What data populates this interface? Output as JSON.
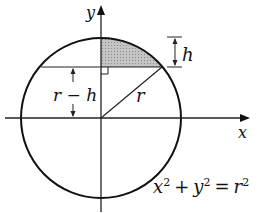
{
  "diagram": {
    "axes": {
      "x_label": "x",
      "y_label": "y"
    },
    "labels": {
      "h": "h",
      "r_minus_h": "r − h",
      "r": "r"
    },
    "equation": {
      "x": "x",
      "x_exp": "2",
      "plus": "+",
      "y": "y",
      "y_exp": "2",
      "equals": "=",
      "r": "r",
      "r_exp": "2"
    },
    "colors": {
      "stroke": "#111111",
      "shading": "#b8b8b8",
      "background": "#ffffff"
    }
  }
}
